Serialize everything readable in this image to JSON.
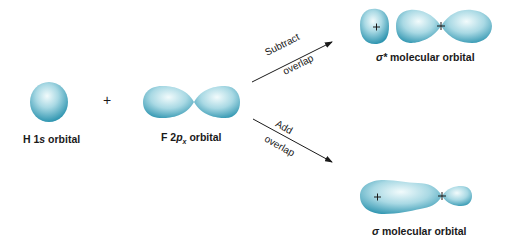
{
  "diagram": {
    "colors": {
      "orbital": "#3a9fb8",
      "orbital_light": "#e8f6f8",
      "text": "#1a1a1a"
    },
    "atomic_orbitals": [
      {
        "id": "h1s",
        "label_prefix": "H 1",
        "label_italic": "s",
        "label_suffix": " orbital"
      },
      {
        "id": "f2px",
        "label_prefix": "F 2",
        "label_italic": "p",
        "label_sub": "x",
        "label_suffix": " orbital"
      }
    ],
    "plus_sign": "+",
    "arrows": [
      {
        "id": "subtract",
        "line1": "Subtract",
        "line2": "overlap"
      },
      {
        "id": "add",
        "line1": "Add",
        "line2": "overlap"
      }
    ],
    "molecular_orbitals": [
      {
        "id": "sigma-star",
        "symbol": "σ*",
        "label": " molecular orbital",
        "nucleus_marks": [
          "+",
          "+"
        ]
      },
      {
        "id": "sigma",
        "symbol": "σ",
        "label": " molecular orbital",
        "nucleus_marks": [
          "+",
          "+"
        ]
      }
    ]
  }
}
